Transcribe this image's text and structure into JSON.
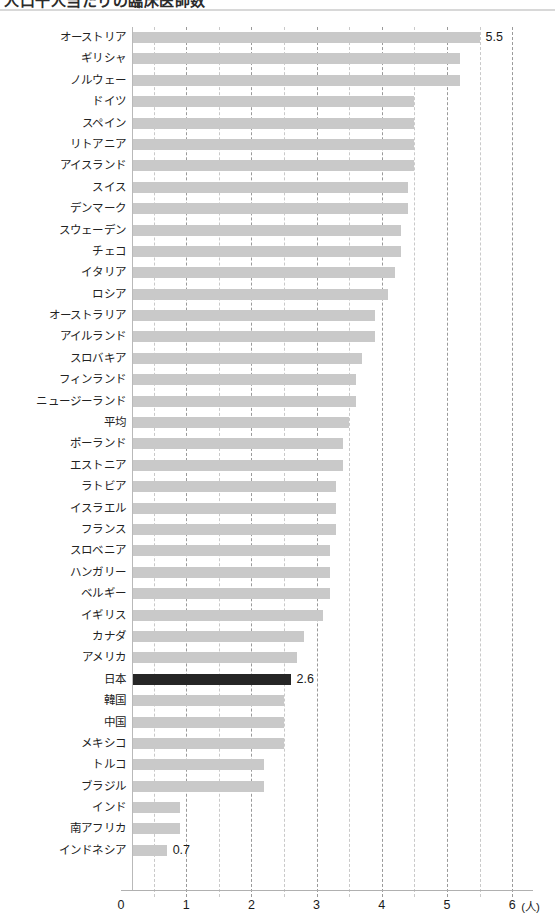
{
  "chart_data": {
    "type": "bar",
    "orientation": "horizontal",
    "title": "",
    "xlabel": "(人)",
    "ylabel": "",
    "xlim": [
      0,
      6
    ],
    "xticks": [
      "0",
      "1",
      "2",
      "3",
      "4",
      "5",
      "6"
    ],
    "xtick_step": 1,
    "minor_grid_step": 0.5,
    "grid": true,
    "legend": "none",
    "bar_color": "#c9c9c9",
    "highlight_color": "#262626",
    "highlight_category": "日本",
    "value_labels_shown": [
      "5.5",
      "2.6",
      "0.7"
    ],
    "categories": [
      "オーストリア",
      "ギリシャ",
      "ノルウェー",
      "ドイツ",
      "スペイン",
      "リトアニア",
      "アイスランド",
      "スイス",
      "デンマーク",
      "スウェーデン",
      "チェコ",
      "イタリア",
      "ロシア",
      "オーストラリア",
      "アイルランド",
      "スロバキア",
      "フィンランド",
      "ニュージーランド",
      "平均",
      "ポーランド",
      "エストニア",
      "ラトビア",
      "イスラエル",
      "フランス",
      "スロベニア",
      "ハンガリー",
      "ベルギー",
      "イギリス",
      "カナダ",
      "アメリカ",
      "日本",
      "韓国",
      "中国",
      "メキシコ",
      "トルコ",
      "ブラジル",
      "インド",
      "南アフリカ",
      "インドネシア"
    ],
    "values": [
      5.5,
      5.2,
      5.2,
      4.5,
      4.5,
      4.5,
      4.5,
      4.4,
      4.4,
      4.3,
      4.3,
      4.2,
      4.1,
      3.9,
      3.9,
      3.7,
      3.6,
      3.6,
      3.5,
      3.4,
      3.4,
      3.3,
      3.3,
      3.3,
      3.2,
      3.2,
      3.2,
      3.1,
      2.8,
      2.7,
      2.6,
      2.5,
      2.5,
      2.5,
      2.2,
      2.2,
      0.9,
      0.9,
      0.7
    ],
    "labeled_points": [
      {
        "category": "オーストリア",
        "label": "5.5"
      },
      {
        "category": "日本",
        "label": "2.6"
      },
      {
        "category": "インドネシア",
        "label": "0.7"
      }
    ]
  },
  "header": {
    "clipped_title": "人口千人当たりの臨床医師数"
  }
}
